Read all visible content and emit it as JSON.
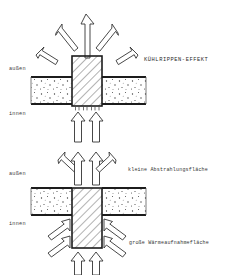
{
  "figure": {
    "title": "KÜHLRIPPEN-EFFEKT",
    "language": "de"
  },
  "diagrams": [
    {
      "id": "upper",
      "name": "kuehlrippen-effekt-diagram",
      "labels": {
        "outside": "außen",
        "inside": "innen",
        "title": "KÜHLRIPPEN-EFFEKT"
      },
      "wall": {
        "hatch": "stipple",
        "x": 31,
        "y": 77,
        "width": 115,
        "height": 27
      },
      "pillar": {
        "hatch": "diagonal",
        "x": 72,
        "y": 56,
        "width": 30,
        "height": 50
      },
      "arrows_out": 5,
      "arrows_in": 2
    },
    {
      "id": "lower",
      "name": "waermebruecke-flaechen-diagram",
      "labels": {
        "outside": "außen",
        "inside": "innen",
        "emission": "kleine Abstrahlungsfläche",
        "absorption": "große Wärmeaufnahmefläche"
      },
      "wall": {
        "hatch": "stipple",
        "x": 31,
        "y": 188,
        "width": 115,
        "height": 27
      },
      "pillar": {
        "hatch": "diagonal",
        "x": 72,
        "y": 188,
        "width": 30,
        "height": 60
      },
      "arrows_out": 4,
      "arrows_in": 6
    }
  ],
  "colors": {
    "ink": "#1c1c1c",
    "paper": "#ffffff",
    "text": "#2b2b2b",
    "hatch": "#555555",
    "stipple": "#3d3d3d"
  }
}
